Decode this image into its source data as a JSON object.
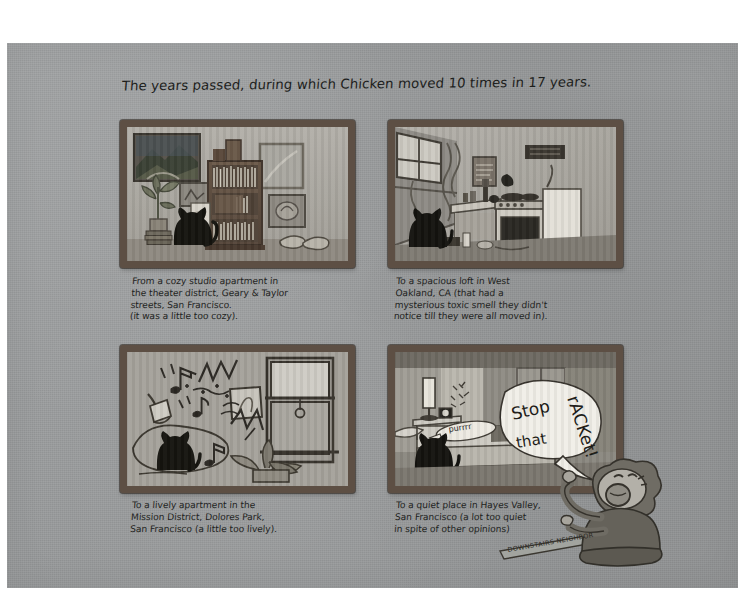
{
  "page": {
    "background_color": "#ffffff",
    "paper_color": "#9b9d9e",
    "ink_color": "#20211f",
    "frame_color": "#5d4f44"
  },
  "title": "The years passed, during which Chicken moved 10 times in 17 years.",
  "panels": [
    {
      "id": "panel-1",
      "scene": "cozy-studio-apartment",
      "caption": "From a cozy studio apartment in\nthe theater district, Geary & Taylor\nstreets, San Francisco.\n(it was a little too cozy).",
      "objects": [
        "landscape-painting",
        "bookshelf",
        "potted-plant",
        "black-cat",
        "small-framed-picture",
        "mirror",
        "slippers",
        "stacked-books"
      ]
    },
    {
      "id": "panel-2",
      "scene": "spacious-loft-west-oakland",
      "caption": "To a spacious loft in West\nOakland, CA (that had a\nmysterious toxic smell they didn't\nnotice till they were all moved in).",
      "objects": [
        "window",
        "hanging-cords",
        "kitchen-counter",
        "stove",
        "black-cat",
        "poster",
        "bottles",
        "range-hood"
      ]
    },
    {
      "id": "panel-3",
      "scene": "lively-apartment-mission-district",
      "caption": "To a lively apartment in the\nMission District, Dolores Park,\nSan Francisco (a little too lively).",
      "objects": [
        "music-notes",
        "noise-lines",
        "desk-lamp",
        "black-cat",
        "framed-picture",
        "sash-window",
        "houseplant"
      ]
    },
    {
      "id": "panel-4",
      "scene": "quiet-place-hayes-valley",
      "caption": "To a quiet place in Hayes Valley,\nSan Francisco (a lot too quiet\nin spite of other opinions)",
      "objects": [
        "table-lamp",
        "alarm-clock",
        "nightstand",
        "bed",
        "black-cat",
        "purr-bubble",
        "shout-bubble",
        "closet-doors"
      ],
      "cat_sound": "purrrr",
      "shout_line_1": "Stop",
      "shout_line_2": "that",
      "shout_line_3": "rACKet!"
    }
  ],
  "neighbor": {
    "label": "DOWNSTAIRS NEIGHBOR",
    "description": "angry-person-with-curly-hair"
  },
  "alarm_clock_marks": "tic tic tic"
}
